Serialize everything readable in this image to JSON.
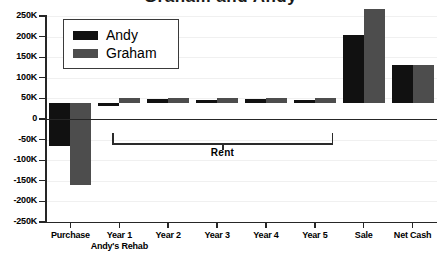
{
  "chart_data": {
    "type": "bar",
    "title": "Graham and Andy",
    "subtitle": "",
    "xlabel": "",
    "ylabel": "",
    "ylim": [
      -250000,
      250000
    ],
    "ytick_values": [
      250000,
      200000,
      150000,
      100000,
      50000,
      0,
      -50000,
      -100000,
      -150000,
      -200000,
      -250000
    ],
    "ytick_labels": [
      "250K",
      "200K",
      "150K",
      "100K",
      "50K",
      "0",
      "-50K",
      "-100K",
      "-150K",
      "-200K",
      "-250K"
    ],
    "grid": true,
    "legend_position": "upper-left",
    "categories": [
      "Purchase",
      "Year 1",
      "Year 2",
      "Year 3",
      "Year 4",
      "Year 5",
      "Sale",
      "Net Cash"
    ],
    "category_sublabels": [
      "",
      "Andy's Rehab",
      "",
      "",
      "",
      "",
      "",
      ""
    ],
    "series": [
      {
        "name": "Andy",
        "color": "#111111",
        "values": [
          -105000,
          -8000,
          9000,
          8000,
          9000,
          8000,
          165000,
          92000
        ]
      },
      {
        "name": "Graham",
        "color": "#4d4d4d",
        "values": [
          -200000,
          12000,
          12000,
          12000,
          13000,
          13000,
          227000,
          92000
        ]
      }
    ],
    "annotations": [
      {
        "type": "bracket",
        "label": "Rent",
        "spans_categories": [
          "Year 1",
          "Year 5"
        ]
      }
    ]
  }
}
